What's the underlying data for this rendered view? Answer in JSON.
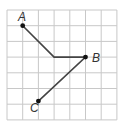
{
  "diagram": {
    "type": "grid-path",
    "grid": {
      "cols": 7,
      "rows": 7,
      "origin_px": [
        7,
        10
      ],
      "cell_px": 15.7,
      "line_color": "#c8c8c8"
    },
    "stroke_color": "#444444",
    "points": [
      {
        "label": "A",
        "grid": [
          1,
          1
        ],
        "dot": true
      },
      {
        "label": "",
        "grid": [
          3,
          3
        ],
        "dot": false
      },
      {
        "label": "B",
        "grid": [
          5,
          3
        ],
        "dot": true
      },
      {
        "label": "C",
        "grid": [
          2,
          5.8
        ],
        "dot": true
      }
    ],
    "labels": {
      "a": "A",
      "b": "B",
      "c": "C"
    }
  }
}
